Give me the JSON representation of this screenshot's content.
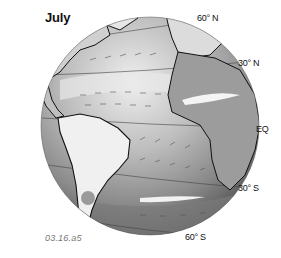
{
  "figure": {
    "title": "July",
    "caption": "03.16.a5",
    "latitude_labels": {
      "lat_60n": "60° N",
      "lat_30n": "30° N",
      "equator": "EQ",
      "lat_30s": "30° S",
      "lat_60s": "60° S"
    }
  },
  "colors": {
    "ocean_light": "#d9d9d9",
    "ocean_mid": "#a8a8a8",
    "ocean_dark": "#6e6e6e",
    "land_light": "#f2f2f2",
    "coastline": "#111111",
    "wind_arrow": "#555555"
  }
}
